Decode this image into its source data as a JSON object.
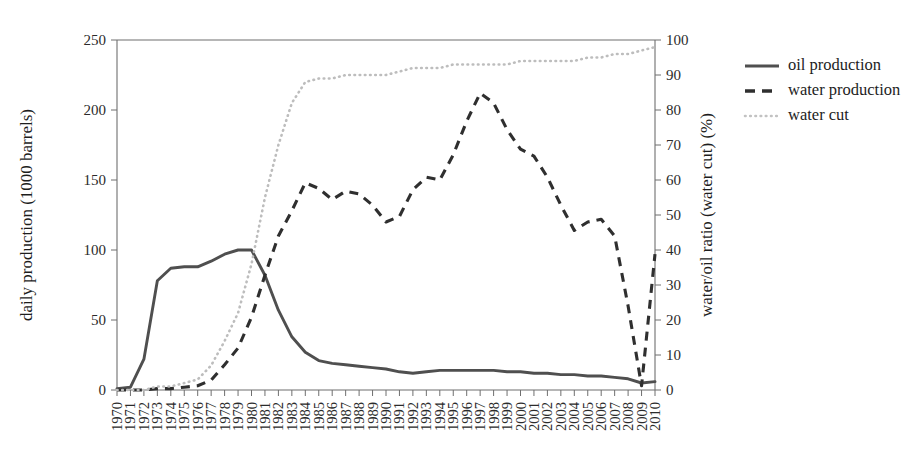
{
  "chart_data": {
    "type": "line",
    "title": "",
    "xlabel": "",
    "ylabel": "daily production (1000 barrels)",
    "y2label": "water/oil ratio (water cut) (%)",
    "grid": false,
    "legend_position": "right",
    "xlim": [
      1970,
      2010
    ],
    "ylim": [
      0,
      250
    ],
    "y2lim": [
      0,
      100
    ],
    "yticks": [
      0,
      50,
      100,
      150,
      200,
      250
    ],
    "y2ticks": [
      0,
      10,
      20,
      30,
      40,
      50,
      60,
      70,
      80,
      90,
      100
    ],
    "x": [
      1970,
      1971,
      1972,
      1973,
      1974,
      1975,
      1976,
      1977,
      1978,
      1979,
      1980,
      1981,
      1982,
      1983,
      1984,
      1985,
      1986,
      1987,
      1988,
      1989,
      1990,
      1991,
      1992,
      1993,
      1994,
      1995,
      1996,
      1997,
      1998,
      1999,
      2000,
      2001,
      2002,
      2003,
      2004,
      2005,
      2006,
      2007,
      2008,
      2009,
      2010
    ],
    "xticklabels": [
      "1970",
      "1971",
      "1972",
      "1973",
      "1974",
      "1975",
      "1976",
      "1977",
      "1978",
      "1979",
      "1980",
      "1981",
      "1982",
      "1983",
      "1984",
      "1985",
      "1986",
      "1987",
      "1988",
      "1989",
      "1990",
      "1991",
      "1992",
      "1993",
      "1994",
      "1995",
      "1996",
      "1997",
      "1998",
      "1999",
      "2000",
      "2001",
      "2002",
      "2003",
      "2004",
      "2005",
      "2006",
      "2007",
      "2008",
      "2009",
      "2010"
    ],
    "series": [
      {
        "name": "oil production",
        "axis": "left",
        "style": "solid",
        "color": "#4f4f4f",
        "values": [
          1,
          2,
          22,
          78,
          87,
          88,
          88,
          92,
          97,
          100,
          100,
          82,
          57,
          38,
          27,
          21,
          19,
          18,
          17,
          16,
          15,
          13,
          12,
          13,
          14,
          14,
          14,
          14,
          14,
          13,
          13,
          12,
          12,
          11,
          11,
          10,
          10,
          9,
          8,
          5,
          6
        ]
      },
      {
        "name": "water production",
        "axis": "left",
        "style": "dashed",
        "color": "#2f2f2f",
        "values": [
          0,
          0,
          0,
          1,
          1,
          2,
          3,
          7,
          18,
          30,
          52,
          82,
          110,
          128,
          148,
          144,
          136,
          142,
          140,
          132,
          120,
          124,
          143,
          152,
          150,
          168,
          192,
          212,
          205,
          186,
          172,
          167,
          152,
          132,
          114,
          120,
          122,
          110,
          60,
          3,
          97
        ]
      },
      {
        "name": "water cut",
        "axis": "right",
        "style": "dotted",
        "color": "#bdbdbd",
        "values": [
          0,
          0,
          0,
          1,
          1,
          2,
          3,
          7,
          14,
          22,
          36,
          55,
          70,
          82,
          88,
          89,
          89,
          90,
          90,
          90,
          90,
          91,
          92,
          92,
          92,
          93,
          93,
          93,
          93,
          93,
          94,
          94,
          94,
          94,
          94,
          95,
          95,
          96,
          96,
          97,
          98
        ]
      }
    ]
  },
  "legend": {
    "items": [
      {
        "label": "oil production"
      },
      {
        "label": "water production"
      },
      {
        "label": "water cut"
      }
    ]
  }
}
